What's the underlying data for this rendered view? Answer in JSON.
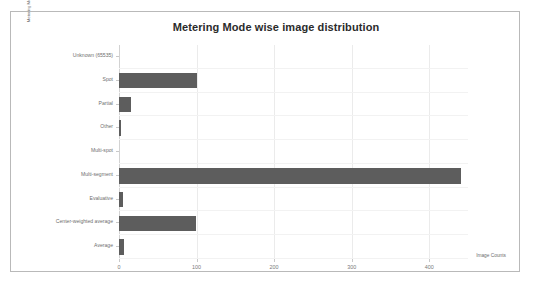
{
  "chart_data": {
    "type": "bar",
    "orientation": "horizontal",
    "title": "Metering Mode wise image distribution",
    "xlabel": "Image Counts",
    "ylabel": "Metering Mode",
    "xlim": [
      0,
      450
    ],
    "xticks": [
      "0",
      "100",
      "200",
      "300",
      "400"
    ],
    "xtick_values": [
      0,
      100,
      200,
      300,
      400
    ],
    "grid": true,
    "legend": "none",
    "bar_color": "#5d5d5d",
    "categories": [
      "Unknown (65535)",
      "Spot",
      "Partial",
      "Other",
      "Multi-spot",
      "Multi-segment",
      "Evaluative",
      "Center-weighted average",
      "Average"
    ],
    "values": [
      0,
      100,
      15,
      2,
      0,
      441,
      5,
      99,
      7
    ]
  }
}
